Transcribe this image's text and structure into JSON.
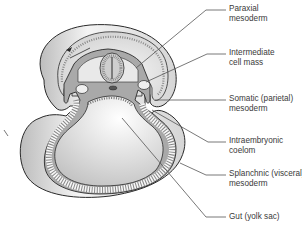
{
  "diagram": {
    "labels": [
      {
        "id": "paraxial",
        "line1": "Paraxial",
        "line2": "mesoderm"
      },
      {
        "id": "intermediate",
        "line1": "Intermediate",
        "line2": "cell mass"
      },
      {
        "id": "somatic",
        "line1": "Somatic (parietal)",
        "line2": "mesoderm"
      },
      {
        "id": "coelom",
        "line1": "Intraembryonic",
        "line2": "coelom"
      },
      {
        "id": "splanchnic",
        "line1": "Splanchnic (visceral)",
        "line2": "mesoderm"
      },
      {
        "id": "gut",
        "line1": "Gut (yolk sac)",
        "line2": ""
      }
    ],
    "colors": {
      "outline": "#2a2a2a",
      "mesoderm": "#a9a9a9",
      "ectoderm_fill": "#dcdcdc",
      "light_fill": "#f2f2f2",
      "leader": "#555555"
    }
  }
}
